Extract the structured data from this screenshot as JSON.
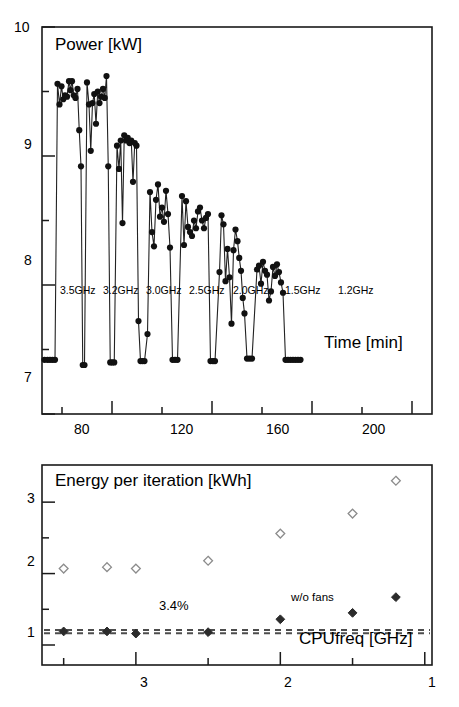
{
  "figure": {
    "background": "#ffffff",
    "foreground": "#1a1a1a",
    "width": 459,
    "height": 707
  },
  "chart_data": [
    {
      "id": "power-vs-time",
      "type": "line",
      "title": "Power [kW]",
      "xlabel": "Time [min]",
      "ylabel": "Power [kW]",
      "xlim": [
        52,
        208
      ],
      "ylim": [
        7,
        10
      ],
      "grid": false,
      "legend": "none",
      "marker": "filled-circle",
      "marker_color": "#111111",
      "line_color": "#222222",
      "y_ticks_major": [
        7,
        8,
        9,
        10
      ],
      "y_ticks_minor": [
        7.5,
        8.5,
        9.5
      ],
      "y_tick_labels": [
        "7",
        "8",
        "9",
        "10"
      ],
      "x_ticks_major": [
        80,
        120,
        160,
        200
      ],
      "x_ticks_minor": [
        60,
        100,
        140,
        180
      ],
      "x_tick_labels": [
        "80",
        "120",
        "160",
        "200"
      ],
      "annotations": [
        {
          "text": "3.5GHz",
          "x": 66.5,
          "y": 7.33
        },
        {
          "text": "3.2GHz",
          "x": 84.5,
          "y": 7.33
        },
        {
          "text": "3.0GHz",
          "x": 102.5,
          "y": 7.33
        },
        {
          "text": "2.5GHz",
          "x": 120.5,
          "y": 7.33
        },
        {
          "text": "2.0GHz",
          "x": 138.5,
          "y": 7.33
        },
        {
          "text": "1.5GHz",
          "x": 160.0,
          "y": 7.33
        },
        {
          "text": "1.2GHz",
          "x": 182.0,
          "y": 7.33
        }
      ],
      "baseline": 7.42,
      "series": [
        {
          "name": "Measured node power",
          "points": [
            [
              53.0,
              7.42
            ],
            [
              54.2,
              7.42
            ],
            [
              55.2,
              7.42
            ],
            [
              56.2,
              7.42
            ],
            [
              57.2,
              7.42
            ],
            [
              58.2,
              9.56
            ],
            [
              59.0,
              9.4
            ],
            [
              59.8,
              9.54
            ],
            [
              60.5,
              9.44
            ],
            [
              61.2,
              9.47
            ],
            [
              62.0,
              9.46
            ],
            [
              62.8,
              9.58
            ],
            [
              63.4,
              9.51
            ],
            [
              64.0,
              9.58
            ],
            [
              64.7,
              9.47
            ],
            [
              65.4,
              9.45
            ],
            [
              66.2,
              9.52
            ],
            [
              66.9,
              9.2
            ],
            [
              67.6,
              8.92
            ],
            [
              68.3,
              7.38
            ],
            [
              69.0,
              7.38
            ],
            [
              70.0,
              9.57
            ],
            [
              70.8,
              9.4
            ],
            [
              71.5,
              9.04
            ],
            [
              72.2,
              9.41
            ],
            [
              72.9,
              9.48
            ],
            [
              73.6,
              9.25
            ],
            [
              74.3,
              9.5
            ],
            [
              75.0,
              9.41
            ],
            [
              75.7,
              9.46
            ],
            [
              76.4,
              9.52
            ],
            [
              77.1,
              9.45
            ],
            [
              77.8,
              9.62
            ],
            [
              78.5,
              8.92
            ],
            [
              79.3,
              7.4
            ],
            [
              80.1,
              7.4
            ],
            [
              80.9,
              7.4
            ],
            [
              82.0,
              9.08
            ],
            [
              82.8,
              8.9
            ],
            [
              83.5,
              9.12
            ],
            [
              84.2,
              8.48
            ],
            [
              84.9,
              9.16
            ],
            [
              85.6,
              9.12
            ],
            [
              86.3,
              9.14
            ],
            [
              87.0,
              9.1
            ],
            [
              87.7,
              9.12
            ],
            [
              88.4,
              8.8
            ],
            [
              89.1,
              9.1
            ],
            [
              89.8,
              9.08
            ],
            [
              90.6,
              7.72
            ],
            [
              91.4,
              7.41
            ],
            [
              92.2,
              7.41
            ],
            [
              93.0,
              7.41
            ],
            [
              94.2,
              7.62
            ],
            [
              95.2,
              8.72
            ],
            [
              96.0,
              8.41
            ],
            [
              96.8,
              8.3
            ],
            [
              97.6,
              8.66
            ],
            [
              98.4,
              8.78
            ],
            [
              99.2,
              8.53
            ],
            [
              100.0,
              8.6
            ],
            [
              100.8,
              8.49
            ],
            [
              101.6,
              8.73
            ],
            [
              102.4,
              8.55
            ],
            [
              103.2,
              8.29
            ],
            [
              104.2,
              7.42
            ],
            [
              105.2,
              7.42
            ],
            [
              106.2,
              7.42
            ],
            [
              108.0,
              8.69
            ],
            [
              108.8,
              8.31
            ],
            [
              109.6,
              8.65
            ],
            [
              110.4,
              8.45
            ],
            [
              111.2,
              8.41
            ],
            [
              112.0,
              8.38
            ],
            [
              112.8,
              8.5
            ],
            [
              113.6,
              8.44
            ],
            [
              114.4,
              8.57
            ],
            [
              115.2,
              8.6
            ],
            [
              116.0,
              8.5
            ],
            [
              116.8,
              8.44
            ],
            [
              117.6,
              8.52
            ],
            [
              118.4,
              8.55
            ],
            [
              119.4,
              7.41
            ],
            [
              120.4,
              7.41
            ],
            [
              121.2,
              7.41
            ],
            [
              123.0,
              8.1
            ],
            [
              123.8,
              8.54
            ],
            [
              124.6,
              8.47
            ],
            [
              125.4,
              8.03
            ],
            [
              126.2,
              8.28
            ],
            [
              127.0,
              8.06
            ],
            [
              127.8,
              7.7
            ],
            [
              128.6,
              8.27
            ],
            [
              129.4,
              8.43
            ],
            [
              130.2,
              8.34
            ],
            [
              130.9,
              8.21
            ],
            [
              131.6,
              8.11
            ],
            [
              132.3,
              7.9
            ],
            [
              133.0,
              7.78
            ],
            [
              134.0,
              7.43
            ],
            [
              135.0,
              7.43
            ],
            [
              136.0,
              7.43
            ],
            [
              138.0,
              8.12
            ],
            [
              138.8,
              8.15
            ],
            [
              139.6,
              8.01
            ],
            [
              140.4,
              8.18
            ],
            [
              141.2,
              8.11
            ],
            [
              142.0,
              8.08
            ],
            [
              142.8,
              7.88
            ],
            [
              143.6,
              7.95
            ],
            [
              144.4,
              8.14
            ],
            [
              145.2,
              8.07
            ],
            [
              146.0,
              8.16
            ],
            [
              146.8,
              8.1
            ],
            [
              147.6,
              8.02
            ],
            [
              148.4,
              7.94
            ],
            [
              149.4,
              7.42
            ],
            [
              150.4,
              7.42
            ],
            [
              151.4,
              7.42
            ],
            [
              152.4,
              7.42
            ],
            [
              153.4,
              7.42
            ],
            [
              154.4,
              7.42
            ],
            [
              155.4,
              7.42
            ]
          ]
        }
      ]
    },
    {
      "id": "energy-per-iteration-vs-cpufreq",
      "type": "scatter",
      "title": "Energy per iteration [kWh]",
      "xlabel": "CPUfreq [GHz]",
      "ylabel": "Energy per iteration [kWh]",
      "xlim": [
        3.65,
        0.95
      ],
      "ylim": [
        0.72,
        3.52
      ],
      "x_inverted": true,
      "grid": false,
      "legend": "none",
      "y_ticks_major": [
        1,
        2,
        3
      ],
      "y_ticks_minor": [
        1.5,
        2.5
      ],
      "y_tick_labels": [
        "1",
        "2",
        "3"
      ],
      "x_ticks_major": [
        3,
        2,
        1
      ],
      "x_ticks_minor": [
        3.5,
        2.5,
        1.5
      ],
      "x_tick_labels": [
        "3",
        "2",
        "1"
      ],
      "annotations": [
        {
          "text": "w/o fans",
          "x": 1.78,
          "y": 1.69
        },
        {
          "text": "3.4%",
          "x": 2.8,
          "y": 1.34
        }
      ],
      "reference_lines": [
        {
          "style": "dashed",
          "y": 1.21,
          "label": "upper",
          "color": "#4d4d4d"
        },
        {
          "style": "dashed",
          "y": 1.165,
          "label": "lower",
          "color": "#4d4d4d"
        }
      ],
      "series": [
        {
          "name": "Total energy (with fans)",
          "marker": "open-diamond",
          "marker_color": "#8c8c8c",
          "x": [
            3.5,
            3.2,
            3.0,
            2.5,
            2.0,
            1.5,
            1.2
          ],
          "y": [
            2.07,
            2.09,
            2.07,
            2.18,
            2.56,
            2.84,
            3.3
          ]
        },
        {
          "name": "w/o fans",
          "marker": "filled-diamond",
          "marker_color": "#2b2b2b",
          "x": [
            3.5,
            3.2,
            3.0,
            2.5,
            2.0,
            1.5,
            1.2
          ],
          "y": [
            1.19,
            1.19,
            1.16,
            1.18,
            1.36,
            1.45,
            1.67
          ]
        }
      ]
    }
  ],
  "top_panel": {
    "axis_title": "Power [kW]",
    "x_axis_title": "Time [min]",
    "y_tick_labels": [
      "10",
      "9",
      "8",
      "7"
    ],
    "x_tick_labels": [
      "80",
      "120",
      "160",
      "200"
    ],
    "phase_labels": [
      "3.5GHz",
      "3.2GHz",
      "3.0GHz",
      "2.5GHz",
      "2.0GHz",
      "1.5GHz",
      "1.2GHz"
    ]
  },
  "bottom_panel": {
    "axis_title": "Energy per iteration [kWh]",
    "x_axis_title": "CPUfreq [GHz]",
    "y_tick_labels": [
      "3",
      "2",
      "1"
    ],
    "x_tick_labels": [
      "3",
      "2",
      "1"
    ],
    "series_label": "w/o fans",
    "delta_label": "3.4%"
  }
}
